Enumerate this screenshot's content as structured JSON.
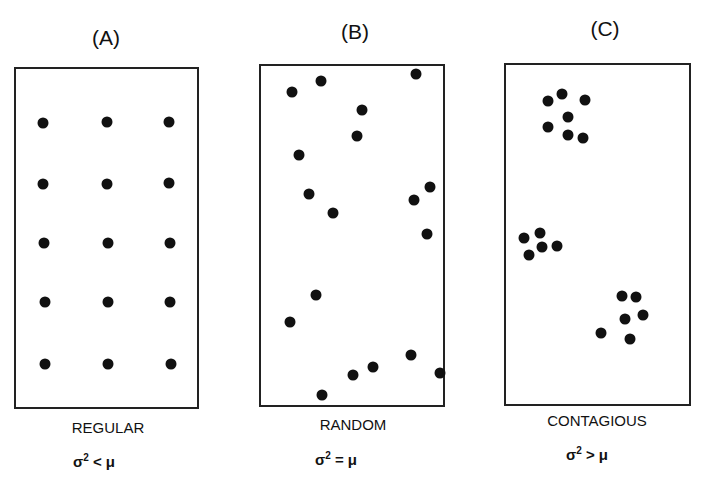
{
  "panels": [
    {
      "title": "(A)",
      "caption": "REGULAR",
      "formula_var": "σ",
      "formula_exp": "2",
      "formula_rel": " < μ",
      "box": {
        "x": 14,
        "y": 67,
        "w": 185,
        "h": 342
      },
      "dots": [
        [
          43,
          123
        ],
        [
          107,
          122
        ],
        [
          169,
          122
        ],
        [
          43,
          184
        ],
        [
          107,
          184
        ],
        [
          169,
          183
        ],
        [
          44,
          243
        ],
        [
          108,
          243
        ],
        [
          170,
          243
        ],
        [
          45,
          302
        ],
        [
          108,
          302
        ],
        [
          170,
          302
        ],
        [
          45,
          364
        ],
        [
          108,
          364
        ],
        [
          171,
          364
        ]
      ]
    },
    {
      "title": "(B)",
      "caption": "RANDOM",
      "formula_var": "σ",
      "formula_exp": "2",
      "formula_rel": " = μ",
      "box": {
        "x": 259,
        "y": 64,
        "w": 186,
        "h": 343
      },
      "dots": [
        [
          292,
          92
        ],
        [
          321,
          81
        ],
        [
          416,
          74
        ],
        [
          362,
          110
        ],
        [
          357,
          136
        ],
        [
          299,
          155
        ],
        [
          309,
          194
        ],
        [
          333,
          213
        ],
        [
          414,
          200
        ],
        [
          430,
          187
        ],
        [
          427,
          234
        ],
        [
          316,
          295
        ],
        [
          290,
          322
        ],
        [
          322,
          395
        ],
        [
          353,
          375
        ],
        [
          373,
          367
        ],
        [
          411,
          355
        ],
        [
          440,
          373
        ]
      ]
    },
    {
      "title": "(C)",
      "caption": "CONTAGIOUS",
      "formula_var": "σ",
      "formula_exp": "2",
      "formula_rel": " > μ",
      "box": {
        "x": 504,
        "y": 63,
        "w": 187,
        "h": 343
      },
      "dots": [
        [
          548,
          101
        ],
        [
          562,
          94
        ],
        [
          585,
          100
        ],
        [
          568,
          117
        ],
        [
          548,
          127
        ],
        [
          568,
          135
        ],
        [
          583,
          138
        ],
        [
          524,
          238
        ],
        [
          540,
          233
        ],
        [
          542,
          247
        ],
        [
          557,
          246
        ],
        [
          529,
          255
        ],
        [
          622,
          296
        ],
        [
          636,
          297
        ],
        [
          643,
          315
        ],
        [
          625,
          319
        ],
        [
          601,
          333
        ],
        [
          630,
          339
        ]
      ]
    }
  ]
}
